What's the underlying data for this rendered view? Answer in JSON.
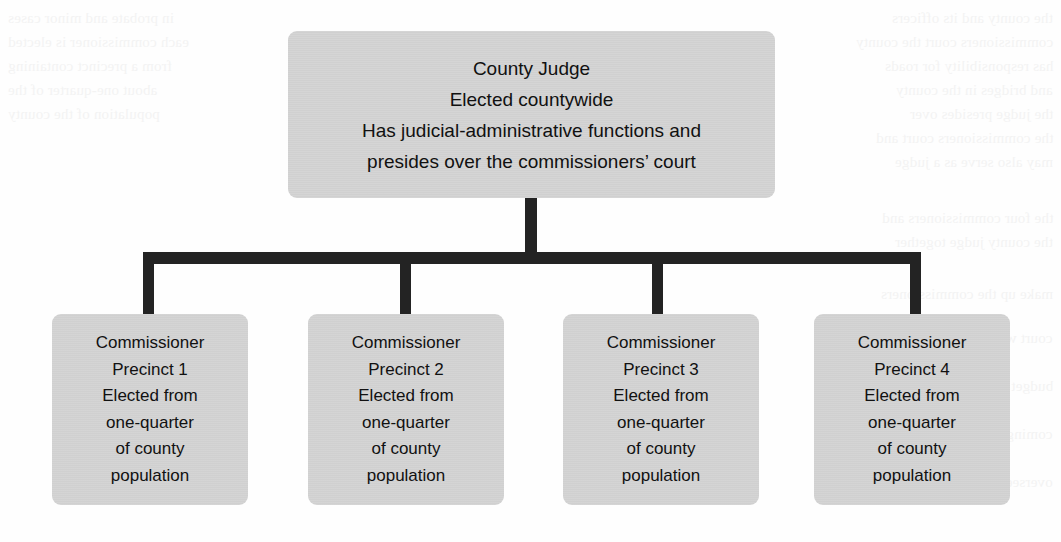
{
  "chart": {
    "type": "org-chart",
    "colors": {
      "node_fill": "#d2d2d2",
      "connector": "#232323",
      "text": "#111111",
      "background": "#fefefe"
    },
    "root": {
      "id": "county-judge",
      "lines": [
        "County Judge",
        "Elected countywide",
        "Has judicial-administrative functions and",
        "presides over the commissioners’ court"
      ]
    },
    "children": [
      {
        "id": "commissioner-1",
        "lines": [
          "Commissioner",
          "Precinct 1",
          "Elected from",
          "one-quarter",
          "of county",
          "population"
        ]
      },
      {
        "id": "commissioner-2",
        "lines": [
          "Commissioner",
          "Precinct 2",
          "Elected from",
          "one-quarter",
          "of county",
          "population"
        ]
      },
      {
        "id": "commissioner-3",
        "lines": [
          "Commissioner",
          "Precinct 3",
          "Elected from",
          "one-quarter",
          "of county",
          "population"
        ]
      },
      {
        "id": "commissioner-4",
        "lines": [
          "Commissioner",
          "Precinct 4",
          "Elected from",
          "one-quarter",
          "of county",
          "population"
        ]
      }
    ]
  },
  "background_ghost_text": {
    "note": "illegible reverse-side bleed-through from the scanned page",
    "lines": [
      "the county and its officers",
      "commissioners court the county",
      "has responsibility for roads",
      "and bridges in the county",
      "the judge presides over",
      "the commissioners court and",
      "may also serve as a judge",
      "in probate and minor cases",
      "each commissioner is elected",
      "from a precinct containing",
      "about one-quarter of the",
      "population of the county",
      "the four commissioners and",
      "the county judge together",
      "make up the commissioners",
      "court which sets the county",
      "budget and tax rate for the",
      "coming fiscal year and also",
      "oversees county buildings"
    ]
  }
}
